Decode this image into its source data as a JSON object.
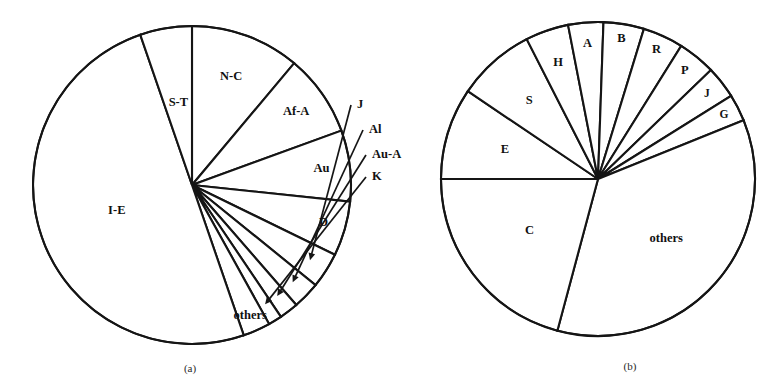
{
  "figure": {
    "background": "#ffffff",
    "line_color": "#151515",
    "text_color": "#111111"
  },
  "panels": [
    {
      "id": "a",
      "caption": "(a)"
    },
    {
      "id": "b",
      "caption": "(b)"
    }
  ],
  "chart_data": [
    {
      "type": "pie",
      "title": "(a)",
      "xlabel": "",
      "ylabel": "",
      "grid": false,
      "legend": "none",
      "labels_on_slices": true,
      "start_angle_deg": 90,
      "direction": "clockwise",
      "center_px": [
        192,
        185
      ],
      "radius_px": 159,
      "categories": [
        "N-C",
        "Af-A",
        "Au",
        "D",
        "J",
        "Al",
        "Au-A",
        "K",
        "others",
        "I-E",
        "S-T"
      ],
      "values": [
        11.1,
        8.3,
        7.2,
        5.6,
        3.6,
        2.8,
        1.9,
        1.4,
        2.8,
        50.0,
        25.3
      ],
      "slices": [
        {
          "label": "N-C",
          "value": 11.1,
          "start_deg": 90.0,
          "end_deg": 50.0,
          "label_pos": "inside"
        },
        {
          "label": "Af-A",
          "value": 8.3,
          "start_deg": 50.0,
          "end_deg": 20.0,
          "label_pos": "inside"
        },
        {
          "label": "Au",
          "value": 7.2,
          "start_deg": 20.0,
          "end_deg": -6.0,
          "label_pos": "inside"
        },
        {
          "label": "D",
          "value": 5.6,
          "start_deg": -6.0,
          "end_deg": -26.0,
          "label_pos": "inside"
        },
        {
          "label": "J",
          "value": 3.6,
          "start_deg": -26.0,
          "end_deg": -39.0,
          "label_pos": "callout"
        },
        {
          "label": "Al",
          "value": 2.8,
          "start_deg": -39.0,
          "end_deg": -49.0,
          "label_pos": "callout"
        },
        {
          "label": "Au-A",
          "value": 1.9,
          "start_deg": -49.0,
          "end_deg": -56.0,
          "label_pos": "callout"
        },
        {
          "label": "K",
          "value": 1.4,
          "start_deg": -56.0,
          "end_deg": -61.0,
          "label_pos": "callout"
        },
        {
          "label": "others",
          "value": 2.8,
          "start_deg": -61.0,
          "end_deg": -71.0,
          "label_pos": "inside"
        },
        {
          "label": "I-E",
          "value": 50.0,
          "start_deg": -71.0,
          "end_deg": -251.0,
          "label_pos": "inside"
        },
        {
          "label": "S-T",
          "value": 25.3,
          "start_deg": 109.0,
          "end_deg": 90.0,
          "label_pos": "inside"
        }
      ],
      "callouts": [
        {
          "label": "J",
          "text_x": 357,
          "text_y": 105
        },
        {
          "label": "Al",
          "text_x": 369,
          "text_y": 130
        },
        {
          "label": "Au-A",
          "text_x": 372,
          "text_y": 155
        },
        {
          "label": "K",
          "text_x": 372,
          "text_y": 177
        }
      ]
    },
    {
      "type": "pie",
      "title": "(b)",
      "xlabel": "",
      "ylabel": "",
      "grid": false,
      "legend": "none",
      "labels_on_slices": true,
      "start_angle_deg": 180,
      "direction": "clockwise",
      "center_px": [
        598,
        179
      ],
      "radius_px": 157,
      "categories": [
        "E",
        "S",
        "H",
        "A",
        "B",
        "R",
        "P",
        "J",
        "G",
        "others",
        "C"
      ],
      "values": [
        9.4,
        8.1,
        7.2,
        6.4,
        6.1,
        5.6,
        5.0,
        3.9,
        3.1,
        25.3,
        19.9
      ],
      "slices": [
        {
          "label": "E",
          "value": 9.4,
          "start_deg": 180.0,
          "end_deg": 146.0,
          "label_pos": "inside"
        },
        {
          "label": "S",
          "value": 8.1,
          "start_deg": 146.0,
          "end_deg": 117.0,
          "label_pos": "inside"
        },
        {
          "label": "H",
          "value": 7.2,
          "start_deg": 117.0,
          "end_deg": 101.0,
          "label_pos": "inside"
        },
        {
          "label": "A",
          "value": 6.4,
          "start_deg": 101.0,
          "end_deg": 88.0,
          "label_pos": "inside"
        },
        {
          "label": "B",
          "value": 6.1,
          "start_deg": 88.0,
          "end_deg": 73.0,
          "label_pos": "inside"
        },
        {
          "label": "R",
          "value": 5.6,
          "start_deg": 73.0,
          "end_deg": 58.0,
          "label_pos": "inside"
        },
        {
          "label": "P",
          "value": 5.0,
          "start_deg": 58.0,
          "end_deg": 44.0,
          "label_pos": "inside"
        },
        {
          "label": "J",
          "value": 3.9,
          "start_deg": 44.0,
          "end_deg": 32.0,
          "label_pos": "inside"
        },
        {
          "label": "G",
          "value": 3.1,
          "start_deg": 32.0,
          "end_deg": 22.0,
          "label_pos": "inside"
        },
        {
          "label": "others",
          "value": 25.3,
          "start_deg": 22.0,
          "end_deg": -105.0,
          "label_pos": "inside"
        },
        {
          "label": "C",
          "value": 19.9,
          "start_deg": -105.0,
          "end_deg": -180.0,
          "label_pos": "inside"
        }
      ],
      "callouts": []
    }
  ]
}
